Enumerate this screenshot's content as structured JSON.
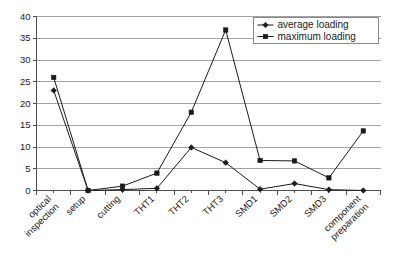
{
  "chart_data": {
    "type": "line",
    "title": "",
    "subtitle": "",
    "xlabel": "",
    "ylabel": "",
    "ylim": [
      0,
      40
    ],
    "yticks": [
      0,
      5,
      10,
      15,
      20,
      25,
      30,
      35,
      40
    ],
    "grid": true,
    "legend_position": "top-right",
    "categories": [
      "optical inspection",
      "setup",
      "cutting",
      "THT1",
      "THT2",
      "THT3",
      "SMD1",
      "SMD2",
      "SMD3",
      "component preparation"
    ],
    "category_lines": [
      [
        "optical",
        "inspection"
      ],
      [
        "setup"
      ],
      [
        "cutting"
      ],
      [
        "THT1"
      ],
      [
        "THT2"
      ],
      [
        "THT3"
      ],
      [
        "SMD1"
      ],
      [
        "SMD2"
      ],
      [
        "SMD3"
      ],
      [
        "component",
        "preparation"
      ]
    ],
    "series": [
      {
        "name": "average loading",
        "marker": "diamond",
        "color": "#1a1a1a",
        "values": [
          23,
          0,
          0.2,
          0.5,
          9.9,
          6.4,
          0.3,
          1.6,
          0.2,
          0
        ]
      },
      {
        "name": "maximum loading",
        "marker": "square",
        "color": "#1a1a1a",
        "values": [
          26,
          0,
          1,
          4,
          18,
          36.9,
          6.9,
          6.8,
          2.9,
          13.7
        ]
      }
    ]
  },
  "legend": {
    "items": [
      {
        "label": "average loading",
        "marker": "diamond"
      },
      {
        "label": "maximum loading",
        "marker": "square"
      }
    ]
  },
  "axes": {
    "y_tick_labels": [
      "40",
      "35",
      "30",
      "25",
      "20",
      "15",
      "10",
      "5",
      "0"
    ]
  }
}
